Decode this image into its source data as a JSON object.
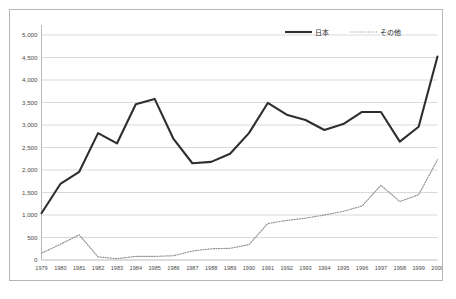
{
  "chart_data": {
    "type": "line",
    "title": "",
    "xlabel": "",
    "ylabel": "",
    "grid": true,
    "legend_position": "top-right",
    "categories": [
      "1979",
      "1980",
      "1981",
      "1982",
      "1983",
      "1984",
      "1985",
      "1986",
      "1987",
      "1988",
      "1989",
      "1990",
      "1991",
      "1992",
      "1993",
      "1994",
      "1995",
      "1996",
      "1997",
      "1998",
      "1999",
      "2000"
    ],
    "x_tick_labels": [
      "1979",
      "1980",
      "1981",
      "1982",
      "1983",
      "1984",
      "1985",
      "1986",
      "1987",
      "1988",
      "1989",
      "1990",
      "1991",
      "1992",
      "1993",
      "1994",
      "1995",
      "1996",
      "1997",
      "1998",
      "1999",
      "2000"
    ],
    "y_tick_labels": [
      "0",
      "500",
      "1,000",
      "1,500",
      "2,000",
      "2,500",
      "3,000",
      "3,500",
      "4,000",
      "4,500",
      "5,000"
    ],
    "y_tick_values": [
      0,
      500,
      1000,
      1500,
      2000,
      2500,
      3000,
      3500,
      4000,
      4500,
      5000
    ],
    "ylim": [
      0,
      5000
    ],
    "xlim": [
      "1979",
      "2000"
    ],
    "series": [
      {
        "name": "日本",
        "style": "solid",
        "color": "#2e2e2e",
        "values": [
          1040,
          1690,
          1960,
          2820,
          2590,
          3460,
          3580,
          2690,
          2150,
          2180,
          2360,
          2820,
          3490,
          3230,
          3110,
          2890,
          3020,
          3290,
          3290,
          2630,
          2960,
          4520
        ]
      },
      {
        "name": "その他",
        "style": "dotted",
        "color": "#8f8f8f",
        "values": [
          150,
          350,
          560,
          70,
          30,
          80,
          80,
          95,
          200,
          250,
          260,
          340,
          810,
          880,
          930,
          1000,
          1080,
          1200,
          1660,
          1300,
          1450,
          2230
        ]
      }
    ]
  },
  "legend": {
    "items": [
      {
        "label": "日本",
        "style": "solid"
      },
      {
        "label": "その他",
        "style": "dotted"
      }
    ]
  }
}
